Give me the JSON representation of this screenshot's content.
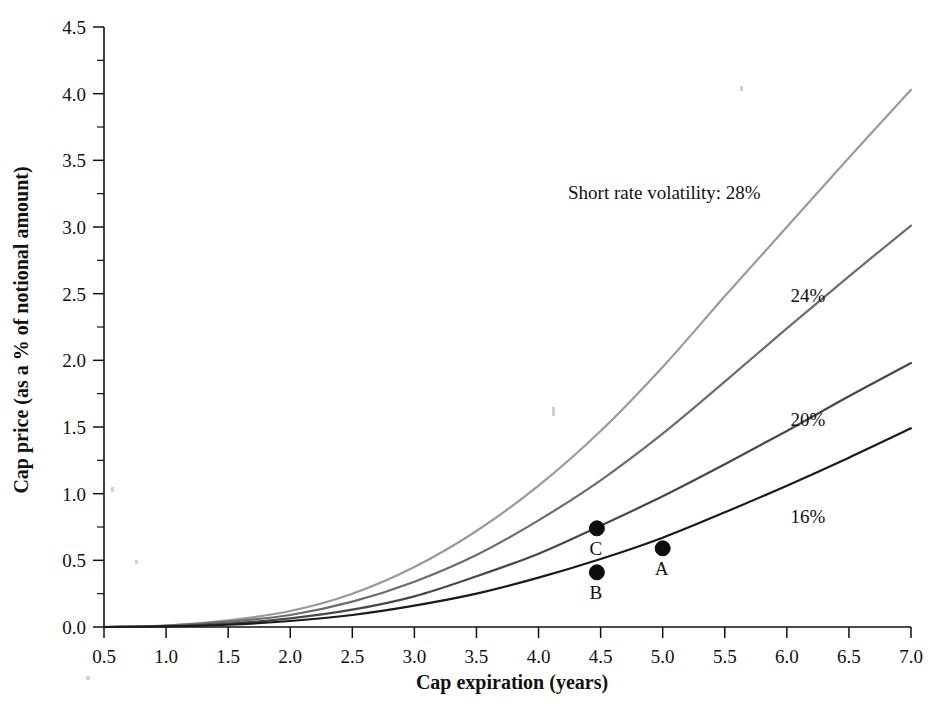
{
  "chart_data": {
    "type": "line",
    "title": "",
    "xlabel": "Cap expiration (years)",
    "ylabel": "Cap price (as a % of notional amount)",
    "xlim": [
      0.5,
      7.0
    ],
    "ylim": [
      0.0,
      4.5
    ],
    "xticks": [
      "0.5",
      "1.0",
      "1.5",
      "2.0",
      "2.5",
      "3.0",
      "3.5",
      "4.0",
      "4.5",
      "5.0",
      "5.5",
      "6.0",
      "6.5",
      "7.0"
    ],
    "xtick_values": [
      0.5,
      1.0,
      1.5,
      2.0,
      2.5,
      3.0,
      3.5,
      4.0,
      4.5,
      5.0,
      5.5,
      6.0,
      6.5,
      7.0
    ],
    "yticks": [
      "0.0",
      "0.5",
      "1.0",
      "1.5",
      "2.0",
      "2.5",
      "3.0",
      "3.5",
      "4.0",
      "4.5"
    ],
    "ytick_values": [
      0.0,
      0.5,
      1.0,
      1.5,
      2.0,
      2.5,
      3.0,
      3.5,
      4.0,
      4.5
    ],
    "grid": false,
    "legend_position": "inline-right-of-curves",
    "annotation": "Short rate volatility: 28%",
    "x": [
      0.5,
      1.0,
      1.5,
      2.0,
      2.5,
      3.0,
      3.5,
      4.0,
      4.5,
      5.0,
      5.5,
      6.0,
      6.5,
      7.0
    ],
    "series": [
      {
        "name": "28%",
        "label": "28%",
        "color": "#9a9a9a",
        "values": [
          0.0,
          0.01,
          0.05,
          0.12,
          0.25,
          0.45,
          0.72,
          1.06,
          1.47,
          1.95,
          2.48,
          3.0,
          3.52,
          4.03
        ]
      },
      {
        "name": "24%",
        "label": "24%",
        "color": "#6d6d6d",
        "values": [
          0.0,
          0.01,
          0.04,
          0.09,
          0.19,
          0.34,
          0.54,
          0.8,
          1.1,
          1.45,
          1.84,
          2.24,
          2.63,
          3.01
        ]
      },
      {
        "name": "20%",
        "label": "20%",
        "color": "#484848",
        "values": [
          0.0,
          0.005,
          0.025,
          0.065,
          0.13,
          0.23,
          0.38,
          0.55,
          0.76,
          0.98,
          1.22,
          1.47,
          1.73,
          1.98
        ]
      },
      {
        "name": "16%",
        "label": "16%",
        "color": "#1a1a1a",
        "values": [
          0.0,
          0.004,
          0.017,
          0.045,
          0.09,
          0.16,
          0.25,
          0.37,
          0.51,
          0.67,
          0.86,
          1.06,
          1.27,
          1.49
        ]
      }
    ],
    "points": [
      {
        "label": "A",
        "x": 5.0,
        "y": 0.59,
        "series": "16%"
      },
      {
        "label": "B",
        "x": 4.47,
        "y": 0.41,
        "series": "16%"
      },
      {
        "label": "C",
        "x": 4.47,
        "y": 0.74,
        "series": "20%"
      }
    ],
    "series_label_positions": [
      {
        "label": "24%",
        "x": 6.17,
        "y": 2.44
      },
      {
        "label": "20%",
        "x": 6.17,
        "y": 1.51
      },
      {
        "label": "16%",
        "x": 6.17,
        "y": 0.78
      }
    ]
  }
}
